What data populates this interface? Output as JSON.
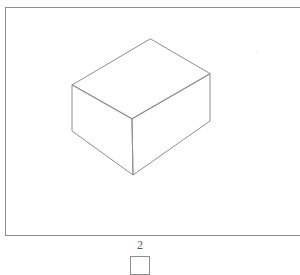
{
  "page": {
    "background_color": "#ffffff",
    "type": "technical-line-drawing"
  },
  "drawing_frame": {
    "name": "drawing-frame",
    "border_color": "#8e8e8e",
    "border_width_px": 1,
    "fill_color": "#ffffff",
    "x": 5,
    "y": 7,
    "width": 299,
    "height": 229,
    "clipped_right_edge": true
  },
  "shape": {
    "name": "isometric-cuboid",
    "description": "Wireframe rectangular box drawn in isometric projection showing top face, left face and right face",
    "stroke_color": "#8e8e8e",
    "stroke_width_px": 1,
    "fill_color": "none",
    "vertices": {
      "top_apex": [
        150,
        39
      ],
      "top_left": [
        72,
        85
      ],
      "top_right": [
        210,
        74
      ],
      "center_junction": [
        132,
        119
      ],
      "bottom_left": [
        72,
        131
      ],
      "bottom_right": [
        210,
        121
      ],
      "bottom_front": [
        133,
        175
      ]
    },
    "faces": [
      {
        "name": "top-face",
        "points": "150,39 72,85 132,119 210,74"
      },
      {
        "name": "left-face",
        "points": "72,85 72,131 133,175 132,119"
      },
      {
        "name": "right-face",
        "points": "132,119 133,175 210,121 210,74"
      }
    ],
    "edges": [
      {
        "name": "top-rear-left-edge",
        "from": [
          150,
          39
        ],
        "to": [
          72,
          85
        ]
      },
      {
        "name": "top-rear-right-edge",
        "from": [
          150,
          39
        ],
        "to": [
          210,
          74
        ]
      },
      {
        "name": "top-front-left-edge",
        "from": [
          72,
          85
        ],
        "to": [
          132,
          119
        ]
      },
      {
        "name": "top-front-right-edge",
        "from": [
          132,
          119
        ],
        "to": [
          210,
          74
        ]
      },
      {
        "name": "left-vertical-edge",
        "from": [
          72,
          85
        ],
        "to": [
          72,
          131
        ]
      },
      {
        "name": "center-vertical-edge",
        "from": [
          132,
          119
        ],
        "to": [
          133,
          175
        ]
      },
      {
        "name": "right-vertical-edge",
        "from": [
          210,
          74
        ],
        "to": [
          210,
          121
        ]
      },
      {
        "name": "bottom-left-edge",
        "from": [
          72,
          131
        ],
        "to": [
          133,
          175
        ]
      },
      {
        "name": "bottom-right-edge",
        "from": [
          133,
          175
        ],
        "to": [
          210,
          121
        ]
      }
    ]
  },
  "caption": {
    "number": "2",
    "number_color": "#5a5a5a",
    "box": {
      "name": "caption-box",
      "border_color": "#8e8e8e",
      "border_width_px": 1,
      "x": 130,
      "y": 256,
      "width": 20,
      "height": 19,
      "clipped_bottom_edge": true
    }
  },
  "artifacts": {
    "speck": {
      "name": "faint-speck",
      "x": 256,
      "y": 51,
      "color": "#f0f0f0"
    }
  }
}
